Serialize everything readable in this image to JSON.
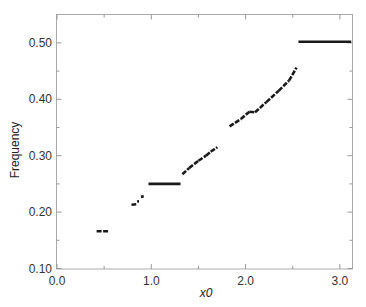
{
  "chart_data": {
    "type": "line",
    "title": "",
    "xlabel": "x0",
    "ylabel": "Frequency",
    "xlim": [
      0.0,
      3.13
    ],
    "ylim": [
      0.1,
      0.55
    ],
    "grid": false,
    "legend": null,
    "x_ticks": [
      {
        "value": 0.0,
        "label": "0.0"
      },
      {
        "value": 1.0,
        "label": "1.0"
      },
      {
        "value": 2.0,
        "label": "2.0"
      },
      {
        "value": 3.0,
        "label": "3.0"
      }
    ],
    "x_minor_ticks": [
      0.5,
      1.5,
      2.5
    ],
    "y_ticks": [
      {
        "value": 0.1,
        "label": "0.10"
      },
      {
        "value": 0.2,
        "label": "0.20"
      },
      {
        "value": 0.3,
        "label": "0.30"
      },
      {
        "value": 0.4,
        "label": "0.40"
      },
      {
        "value": 0.5,
        "label": "0.50"
      }
    ],
    "y_minor_ticks": [
      0.15,
      0.25,
      0.35,
      0.45
    ],
    "series": [
      {
        "name": "Frequency vs x0",
        "style": "piecewise step segments",
        "segments": [
          {
            "x": [
              0.42,
              0.55
            ],
            "y": [
              0.166,
              0.166
            ]
          },
          {
            "x": [
              0.79,
              0.84
            ],
            "y": [
              0.213,
              0.214
            ]
          },
          {
            "x": [
              0.85,
              0.87
            ],
            "y": [
              0.219,
              0.219
            ]
          },
          {
            "x": [
              0.89,
              0.92
            ],
            "y": [
              0.227,
              0.228
            ]
          },
          {
            "x": [
              0.97,
              1.31
            ],
            "y": [
              0.25,
              0.25
            ]
          },
          {
            "x": [
              1.33,
              1.4
            ],
            "y": [
              0.267,
              0.278
            ]
          },
          {
            "x": [
              1.4,
              1.5
            ],
            "y": [
              0.278,
              0.291
            ]
          },
          {
            "x": [
              1.5,
              1.58
            ],
            "y": [
              0.291,
              0.3
            ]
          },
          {
            "x": [
              1.58,
              1.63
            ],
            "y": [
              0.3,
              0.307
            ]
          },
          {
            "x": [
              1.63,
              1.7
            ],
            "y": [
              0.307,
              0.315
            ]
          },
          {
            "x": [
              1.83,
              1.95
            ],
            "y": [
              0.352,
              0.365
            ]
          },
          {
            "x": [
              1.95,
              2.04
            ],
            "y": [
              0.365,
              0.378
            ]
          },
          {
            "x": [
              2.04,
              2.1
            ],
            "y": [
              0.378,
              0.377
            ]
          },
          {
            "x": [
              2.1,
              2.22
            ],
            "y": [
              0.377,
              0.395
            ]
          },
          {
            "x": [
              2.22,
              2.35
            ],
            "y": [
              0.395,
              0.415
            ]
          },
          {
            "x": [
              2.35,
              2.46
            ],
            "y": [
              0.415,
              0.433
            ]
          },
          {
            "x": [
              2.46,
              2.54
            ],
            "y": [
              0.433,
              0.456
            ]
          },
          {
            "x": [
              2.56,
              3.12
            ],
            "y": [
              0.502,
              0.502
            ]
          }
        ]
      }
    ]
  }
}
